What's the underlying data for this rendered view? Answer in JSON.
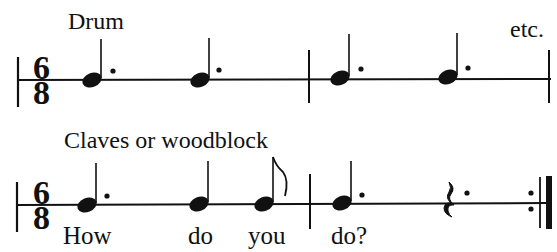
{
  "rows": [
    {
      "instrument": "Drum",
      "trailing_text": "etc.",
      "time_signature": {
        "top": "6",
        "bottom": "8"
      },
      "measures": [
        [
          "dotted-quarter",
          "dotted-quarter"
        ],
        [
          "dotted-quarter",
          "dotted-quarter"
        ]
      ]
    },
    {
      "instrument": "Claves or woodblock",
      "time_signature": {
        "top": "6",
        "bottom": "8"
      },
      "measures": [
        [
          "dotted-quarter",
          "quarter",
          "eighth"
        ],
        [
          "dotted-quarter",
          "dotted-quarter-rest"
        ]
      ],
      "end_barline": "repeat-end",
      "lyrics": [
        "How",
        "do",
        "you",
        "do?"
      ]
    }
  ]
}
